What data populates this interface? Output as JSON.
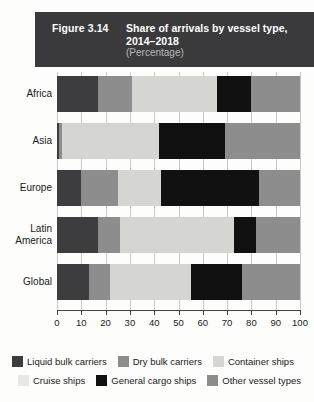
{
  "header": {
    "figure_number": "Figure 3.14",
    "title": "Share of arrivals by vessel type, 2014–2018",
    "subtitle": "(Percentage)",
    "bg_color": "#3a3a3c",
    "text_color": "#ffffff",
    "subtitle_color": "#b9b9bb"
  },
  "chart_data": {
    "type": "bar",
    "orientation": "horizontal",
    "stacked": true,
    "title": "Share of arrivals by vessel type, 2014–2018",
    "subtitle": "(Percentage)",
    "xlabel": "",
    "ylabel": "",
    "xlim": [
      0,
      100
    ],
    "xticks": [
      0,
      10,
      20,
      30,
      40,
      50,
      60,
      70,
      80,
      90,
      100
    ],
    "xtick_labels": [
      "0",
      "10",
      "20",
      "30",
      "40",
      "50",
      "60",
      "70",
      "80",
      "90",
      "100"
    ],
    "grid": true,
    "grid_axis": "x",
    "legend_position": "bottom",
    "categories": [
      "Africa",
      "Asia",
      "Europe",
      "Latin America",
      "Global"
    ],
    "series": [
      {
        "name": "Liquid bulk carriers",
        "color": "#3d3d3f",
        "values": [
          17,
          1,
          10,
          17,
          13
        ]
      },
      {
        "name": "Dry bulk carriers",
        "color": "#8d8d8d",
        "values": [
          14,
          1,
          15,
          9,
          9
        ]
      },
      {
        "name": "Container ships",
        "color": "#d5d5d2",
        "values": [
          35,
          40,
          18,
          47,
          33
        ]
      },
      {
        "name": "Cruise ships",
        "color": "#e8e8e5",
        "values": [
          0,
          0,
          0,
          0,
          0
        ]
      },
      {
        "name": "General cargo ships",
        "color": "#111111",
        "values": [
          14,
          27,
          40,
          9,
          21
        ]
      },
      {
        "name": "Other vessel types",
        "color": "#8d8d8d",
        "values": [
          20,
          31,
          17,
          18,
          24
        ]
      }
    ]
  },
  "legend": {
    "row1": [
      {
        "label": "Liquid bulk carriers",
        "color": "#3d3d3f"
      },
      {
        "label": "Dry bulk carriers",
        "color": "#8d8d8d"
      },
      {
        "label": "Container ships",
        "color": "#d5d5d2"
      }
    ],
    "row2": [
      {
        "label": "Cruise ships",
        "color": "#e8e8e5"
      },
      {
        "label": "General cargo ships",
        "color": "#111111"
      },
      {
        "label": "Other vessel types",
        "color": "#8d8d8d"
      }
    ]
  }
}
